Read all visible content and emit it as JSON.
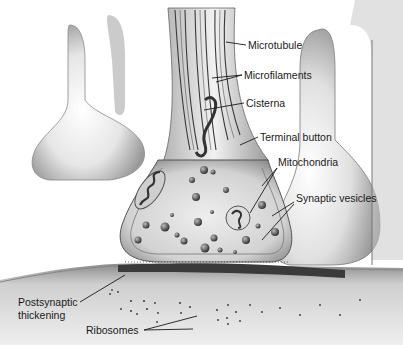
{
  "diagram": {
    "labels": [
      {
        "id": "microtubule",
        "text": "Microtubule",
        "x": 248,
        "y": 40
      },
      {
        "id": "microfilaments",
        "text": "Microfilaments",
        "x": 244,
        "y": 70
      },
      {
        "id": "cisterna",
        "text": "Cisterna",
        "x": 246,
        "y": 98
      },
      {
        "id": "terminal-button",
        "text": "Terminal button",
        "x": 260,
        "y": 132
      },
      {
        "id": "mitochondria",
        "text": "Mitochondria",
        "x": 278,
        "y": 157
      },
      {
        "id": "synaptic-vesicles",
        "text": "Synaptic vesicles",
        "x": 296,
        "y": 193
      },
      {
        "id": "postsynaptic-thickening-1",
        "text": "Postsynaptic",
        "x": 18,
        "y": 298
      },
      {
        "id": "postsynaptic-thickening-2",
        "text": "thickening",
        "x": 18,
        "y": 312
      },
      {
        "id": "ribosomes",
        "text": "Ribosomes",
        "x": 86,
        "y": 325
      }
    ],
    "colors": {
      "ink": "#1a1a1a",
      "shade_dark": "#6e6e6e",
      "shade_mid": "#a8a8a8",
      "shade_light": "#dcdcdc",
      "background": "#ffffff"
    }
  }
}
